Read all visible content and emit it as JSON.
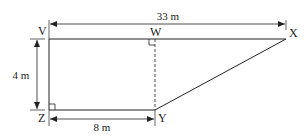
{
  "diagram": {
    "points": {
      "V": {
        "label": "V",
        "x": 49,
        "y": 39
      },
      "W": {
        "label": "W",
        "x": 155,
        "y": 39
      },
      "X": {
        "label": "X",
        "x": 286,
        "y": 39
      },
      "Y": {
        "label": "Y",
        "x": 155,
        "y": 110
      },
      "Z": {
        "label": "Z",
        "x": 49,
        "y": 110
      }
    },
    "dimensions": {
      "top": {
        "label": "33 m",
        "from": "V",
        "to": "X"
      },
      "left": {
        "label": "4 m",
        "from": "V",
        "to": "Z"
      },
      "bottom": {
        "label": "8 m",
        "from": "Z",
        "to": "Y"
      }
    },
    "right_angles": [
      "Z",
      "W"
    ],
    "dashed_segments": [
      [
        "W",
        "Y"
      ]
    ],
    "colors": {
      "stroke": "#222222",
      "background": "#ffffff"
    }
  }
}
